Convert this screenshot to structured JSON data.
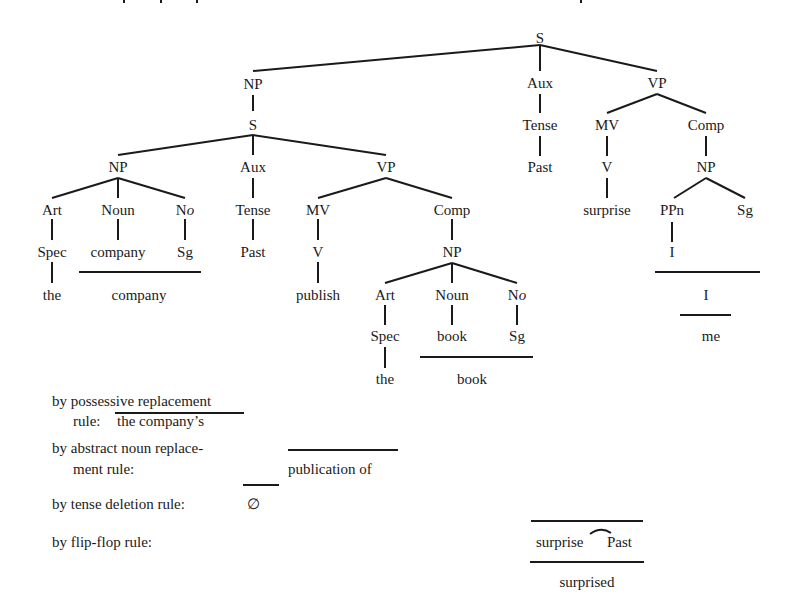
{
  "tree": {
    "root": "S",
    "subject_np": "NP",
    "embedded_s": "S",
    "emb_np": "NP",
    "emb_np_art": "Art",
    "emb_np_noun": "Noun",
    "emb_np_no_n": "N",
    "emb_np_no_o": "o",
    "emb_np_spec": "Spec",
    "emb_np_company": "company",
    "emb_np_sg": "Sg",
    "emb_np_the": "the",
    "emb_np_company_out": "company",
    "emb_aux": "Aux",
    "emb_tense": "Tense",
    "emb_past": "Past",
    "emb_vp": "VP",
    "emb_mv": "MV",
    "emb_v": "V",
    "emb_publish": "publish",
    "emb_comp": "Comp",
    "obj_np": "NP",
    "obj_art": "Art",
    "obj_noun": "Noun",
    "obj_no_n": "N",
    "obj_no_o": "o",
    "obj_spec": "Spec",
    "obj_book": "book",
    "obj_sg": "Sg",
    "obj_the": "the",
    "obj_book_out": "book",
    "main_aux": "Aux",
    "main_tense": "Tense",
    "main_past": "Past",
    "main_vp": "VP",
    "main_mv": "MV",
    "main_v": "V",
    "main_surprise": "surprise",
    "main_comp": "Comp",
    "main_np": "NP",
    "main_ppn": "PPn",
    "main_sg": "Sg",
    "main_i": "I",
    "main_i_out": "I",
    "main_me": "me"
  },
  "rules": {
    "possessive_line1": "by possessive replacement",
    "possessive_line2": "rule:",
    "possessive_result": "the company’s",
    "abstract_line1": "by abstract noun replace-",
    "abstract_line2": "ment rule:",
    "abstract_result": "publication of",
    "tense_label": "by tense deletion rule:",
    "tense_result": "∅",
    "flipflop_label": "by flip-flop rule:",
    "flipflop_word1": "surprise",
    "flipflop_word2": "Past",
    "flipflop_result": "surprised"
  }
}
